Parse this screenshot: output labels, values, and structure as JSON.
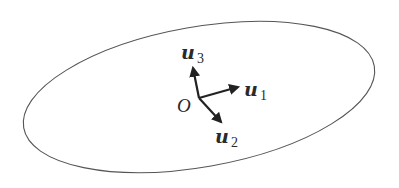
{
  "diagram": {
    "origin_label": "O",
    "vectors": [
      {
        "name": "u",
        "subscript": "1"
      },
      {
        "name": "u",
        "subscript": "2"
      },
      {
        "name": "u",
        "subscript": "3"
      }
    ],
    "colors": {
      "outline": "#555555",
      "arrows": "#222222",
      "text": "#2a2a2a"
    }
  }
}
